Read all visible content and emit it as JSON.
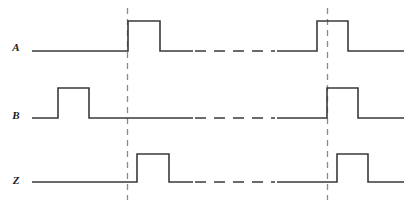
{
  "diagram": {
    "type": "timing-waveform",
    "width": 414,
    "height": 208,
    "background_color": "#ffffff",
    "line_color": "#3a3a3a",
    "marker_color": "#8a8a8a",
    "label_color": "#1a1a1a",
    "time_axis": {
      "visible": false,
      "x_start": 32,
      "x_end": 404,
      "break_start": 193,
      "break_end": 277
    },
    "markers": [
      {
        "name": "marker-1",
        "x": 127.5,
        "y_top": 8,
        "y_bottom": 200,
        "style": "dashed",
        "aligned_with": "A rising edge (first pulse)"
      },
      {
        "name": "marker-2",
        "x": 327.5,
        "y_top": 8,
        "y_bottom": 200,
        "style": "dashed",
        "aligned_with": "B rising edge (second pulse)"
      }
    ],
    "signals": [
      {
        "name": "A",
        "label": "A",
        "label_x": 16,
        "label_y": 48,
        "baseline_y": 51,
        "high_y": 21,
        "pulses": [
          {
            "rise": 128,
            "fall": 160
          },
          {
            "rise": 317,
            "fall": 348
          }
        ],
        "path": "M32,51 L128,51 L128,21 L160,21 L160,51 L193,51",
        "path_after_break": "M277,51 L317,51 L317,21 L348,21 L348,51 L404,51",
        "break_line": "M195,51 L275,51"
      },
      {
        "name": "B",
        "label": "B",
        "label_x": 16,
        "label_y": 116,
        "baseline_y": 118,
        "high_y": 88,
        "pulses": [
          {
            "rise": 58,
            "fall": 89
          },
          {
            "rise": 327,
            "fall": 358
          }
        ],
        "path": "M32,118 L58,118 L58,88 L89,88 L89,118 L193,118",
        "path_after_break": "M277,118 L327,118 L327,88 L358,88 L358,118 L404,118",
        "break_line": "M195,118 L275,118"
      },
      {
        "name": "Z",
        "label": "Z",
        "label_x": 16,
        "label_y": 181,
        "baseline_y": 182,
        "high_y": 154,
        "pulses": [
          {
            "rise": 137,
            "fall": 169
          },
          {
            "rise": 337,
            "fall": 368
          }
        ],
        "path": "M32,182 L137,182 L137,154 L169,154 L169,182 L193,182",
        "path_after_break": "M277,182 L337,182 L337,154 L368,154 L368,182 L404,182",
        "break_line": "M195,182 L275,182"
      }
    ]
  }
}
